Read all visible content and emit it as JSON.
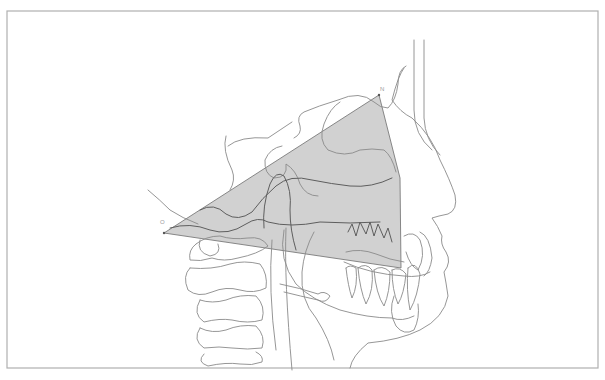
{
  "figure": {
    "type": "cephalometric-tracing",
    "frame": {
      "x": 7,
      "y": 11,
      "width": 591,
      "height": 357,
      "stroke": "#b0b0b0"
    },
    "shaded_region": {
      "fill": "#c9c9c9",
      "stroke": "#7a7a7a",
      "points": [
        [
          164,
          233
        ],
        [
          379,
          95
        ],
        [
          400,
          178
        ],
        [
          401,
          268
        ]
      ]
    },
    "landmarks": [
      {
        "id": "left-vertex",
        "label": "O",
        "x": 164,
        "y": 233,
        "label_x": 160,
        "label_y": 219
      },
      {
        "id": "top-vertex",
        "label": "N",
        "x": 379,
        "y": 95,
        "label_x": 380,
        "label_y": 86
      }
    ],
    "colors": {
      "line": "#8a8a8a",
      "line_dark": "#5e5e5e",
      "shade": "#c9c9c9",
      "background": "#ffffff"
    }
  }
}
